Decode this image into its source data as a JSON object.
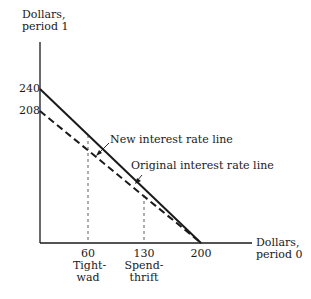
{
  "diagram": {
    "y_axis_label_line1": "Dollars,",
    "y_axis_label_line2": "period 1",
    "x_axis_label_line1": "Dollars,",
    "x_axis_label_line2": "period 0",
    "y_ticks": [
      "240",
      "208"
    ],
    "x_ticks": [
      "60",
      "130",
      "200"
    ],
    "tightwad_line1": "Tight-",
    "tightwad_line2": "wad",
    "spendthrift_line1": "Spend-",
    "spendthrift_line2": "thrift",
    "new_line_label": "New interest rate line",
    "original_line_label": "Original interest rate line"
  },
  "lines": [
    {
      "name": "New interest rate line",
      "style": "solid",
      "from": [
        0,
        240
      ],
      "to": [
        200,
        0
      ]
    },
    {
      "name": "Original interest rate line",
      "style": "dashed",
      "from": [
        0,
        208
      ],
      "to": [
        200,
        0
      ]
    }
  ],
  "reference_points": [
    {
      "name": "Tightwad",
      "x": 60
    },
    {
      "name": "Spendthrift",
      "x": 130
    }
  ]
}
